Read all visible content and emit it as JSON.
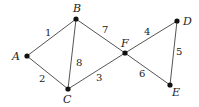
{
  "graph": {
    "nodes": [
      {
        "id": "A",
        "x": 27,
        "y": 56,
        "lx": 12,
        "ly": 60
      },
      {
        "id": "B",
        "x": 76,
        "y": 19,
        "lx": 73,
        "ly": 12
      },
      {
        "id": "C",
        "x": 68,
        "y": 89,
        "lx": 63,
        "ly": 103
      },
      {
        "id": "F",
        "x": 125,
        "y": 53,
        "lx": 121,
        "ly": 47
      },
      {
        "id": "D",
        "x": 177,
        "y": 21,
        "lx": 183,
        "ly": 25
      },
      {
        "id": "E",
        "x": 170,
        "y": 85,
        "lx": 172,
        "ly": 96
      }
    ],
    "edges": [
      {
        "from": "A",
        "to": "B",
        "weight": "1",
        "lx": 45,
        "ly": 36
      },
      {
        "from": "A",
        "to": "C",
        "weight": "2",
        "lx": 39,
        "ly": 82
      },
      {
        "from": "B",
        "to": "C",
        "weight": "8",
        "lx": 76,
        "ly": 66
      },
      {
        "from": "B",
        "to": "F",
        "weight": "7",
        "lx": 102,
        "ly": 33
      },
      {
        "from": "C",
        "to": "F",
        "weight": "3",
        "lx": 96,
        "ly": 81
      },
      {
        "from": "F",
        "to": "D",
        "weight": "4",
        "lx": 144,
        "ly": 35
      },
      {
        "from": "D",
        "to": "E",
        "weight": "5",
        "lx": 176,
        "ly": 55
      },
      {
        "from": "F",
        "to": "E",
        "weight": "6",
        "lx": 139,
        "ly": 77
      }
    ]
  }
}
